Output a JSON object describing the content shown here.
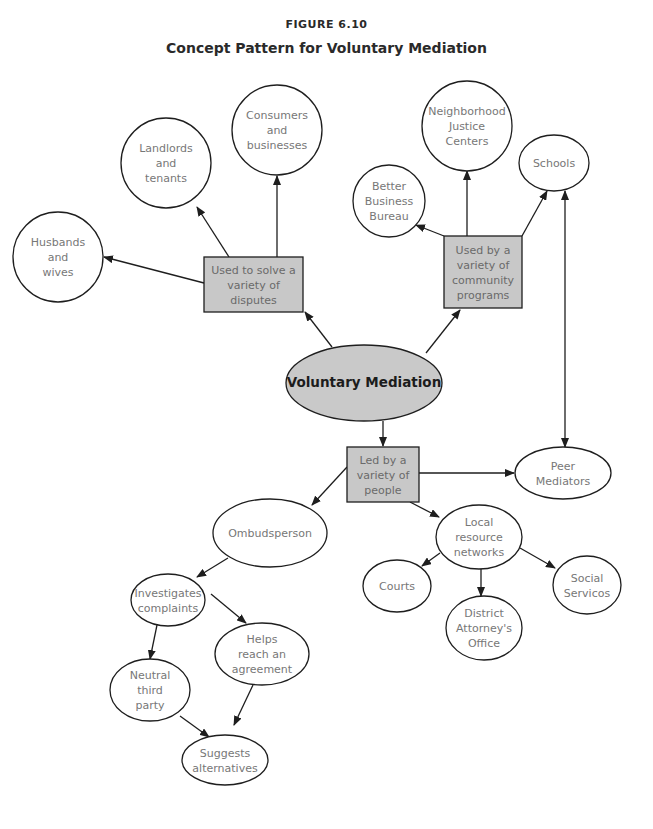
{
  "figure": {
    "label": "FIGURE 6.10",
    "title": "Concept Pattern for Voluntary Mediation"
  },
  "colors": {
    "box_fill": "#c8c8c8",
    "center_fill": "#c9c9c9",
    "circle_fill": "#ffffff",
    "stroke": "#1e1e1e"
  },
  "nodes": [
    {
      "id": "center",
      "shape": "ellipse",
      "cx": 364,
      "cy": 383,
      "rx": 78,
      "ry": 38,
      "lines": [
        "Voluntary Mediation"
      ],
      "style": "center"
    },
    {
      "id": "disputes",
      "shape": "box",
      "x": 204,
      "y": 257,
      "w": 99,
      "h": 55,
      "lines": [
        "Used to solve a",
        "variety of",
        "disputes"
      ]
    },
    {
      "id": "husbands",
      "shape": "circle",
      "cx": 58,
      "cy": 257,
      "r": 45,
      "lines": [
        "Husbands",
        "and",
        "wives"
      ]
    },
    {
      "id": "landlords",
      "shape": "circle",
      "cx": 166,
      "cy": 163,
      "r": 45,
      "lines": [
        "Landlords",
        "and",
        "tenants"
      ]
    },
    {
      "id": "consumers",
      "shape": "circle",
      "cx": 277,
      "cy": 130,
      "r": 45,
      "lines": [
        "Consumers",
        "and",
        "businesses"
      ]
    },
    {
      "id": "community",
      "shape": "box",
      "x": 444,
      "y": 236,
      "w": 78,
      "h": 72,
      "lines": [
        "Used by a",
        "variety of",
        "community",
        "programs"
      ]
    },
    {
      "id": "bbb",
      "shape": "circle",
      "cx": 389,
      "cy": 201,
      "r": 36,
      "lines": [
        "Better",
        "Business",
        "Bureau"
      ]
    },
    {
      "id": "nj",
      "shape": "circle",
      "cx": 467,
      "cy": 126,
      "r": 45,
      "lines": [
        "Neighborhood",
        "Justice",
        "Centers"
      ]
    },
    {
      "id": "schools",
      "shape": "ellipse",
      "cx": 554,
      "cy": 163,
      "rx": 35,
      "ry": 28,
      "lines": [
        "Schools"
      ]
    },
    {
      "id": "led",
      "shape": "box",
      "x": 347,
      "y": 447,
      "w": 72,
      "h": 55,
      "lines": [
        "Led by a",
        "variety of",
        "people"
      ]
    },
    {
      "id": "peer",
      "shape": "ellipse",
      "cx": 563,
      "cy": 473,
      "rx": 48,
      "ry": 26,
      "lines": [
        "Peer",
        "Mediators"
      ]
    },
    {
      "id": "ombuds",
      "shape": "ellipse",
      "cx": 270,
      "cy": 533,
      "rx": 57,
      "ry": 34,
      "lines": [
        "Ombudsperson"
      ]
    },
    {
      "id": "local",
      "shape": "ellipse",
      "cx": 479,
      "cy": 537,
      "rx": 43,
      "ry": 32,
      "lines": [
        "Local",
        "resource",
        "networks"
      ]
    },
    {
      "id": "courts",
      "shape": "ellipse",
      "cx": 397,
      "cy": 586,
      "rx": 34,
      "ry": 26,
      "lines": [
        "Courts"
      ]
    },
    {
      "id": "social",
      "shape": "ellipse",
      "cx": 587,
      "cy": 585,
      "rx": 34,
      "ry": 29,
      "lines": [
        "Social",
        "Servicos"
      ]
    },
    {
      "id": "da",
      "shape": "ellipse",
      "cx": 484,
      "cy": 628,
      "rx": 38,
      "ry": 32,
      "lines": [
        "District",
        "Attorney's",
        "Office"
      ]
    },
    {
      "id": "investigates",
      "shape": "ellipse",
      "cx": 168,
      "cy": 600,
      "rx": 37,
      "ry": 26,
      "lines": [
        "Investigates",
        "complaints"
      ]
    },
    {
      "id": "helps",
      "shape": "ellipse",
      "cx": 262,
      "cy": 654,
      "rx": 47,
      "ry": 31,
      "lines": [
        "Helps",
        "reach an",
        "agreement"
      ]
    },
    {
      "id": "neutral",
      "shape": "ellipse",
      "cx": 150,
      "cy": 690,
      "rx": 40,
      "ry": 31,
      "lines": [
        "Neutral",
        "third",
        "party"
      ]
    },
    {
      "id": "suggests",
      "shape": "ellipse",
      "cx": 225,
      "cy": 760,
      "rx": 43,
      "ry": 25,
      "lines": [
        "Suggests",
        "alternatives"
      ]
    }
  ],
  "edges": [
    {
      "from": [
        332,
        347
      ],
      "to": [
        305,
        312
      ],
      "head": "end"
    },
    {
      "from": [
        204,
        283
      ],
      "to": [
        104,
        257
      ],
      "head": "end"
    },
    {
      "from": [
        229,
        257
      ],
      "to": [
        197,
        207
      ],
      "head": "end"
    },
    {
      "from": [
        277,
        257
      ],
      "to": [
        277,
        176
      ],
      "head": "end"
    },
    {
      "from": [
        426,
        353
      ],
      "to": [
        460,
        310
      ],
      "head": "end"
    },
    {
      "from": [
        444,
        236
      ],
      "to": [
        416,
        225
      ],
      "head": "end"
    },
    {
      "from": [
        467,
        236
      ],
      "to": [
        467,
        171
      ],
      "head": "end"
    },
    {
      "from": [
        522,
        236
      ],
      "to": [
        547,
        191
      ],
      "head": "end"
    },
    {
      "from": [
        565,
        191
      ],
      "to": [
        565,
        447
      ],
      "head": "both"
    },
    {
      "from": [
        383,
        421
      ],
      "to": [
        383,
        446
      ],
      "head": "end"
    },
    {
      "from": [
        419,
        473
      ],
      "to": [
        514,
        473
      ],
      "head": "end"
    },
    {
      "from": [
        347,
        467
      ],
      "to": [
        312,
        505
      ],
      "head": "end"
    },
    {
      "from": [
        410,
        502
      ],
      "to": [
        439,
        517
      ],
      "head": "end"
    },
    {
      "from": [
        440,
        553
      ],
      "to": [
        422,
        566
      ],
      "head": "end"
    },
    {
      "from": [
        481,
        569
      ],
      "to": [
        481,
        596
      ],
      "head": "end"
    },
    {
      "from": [
        520,
        548
      ],
      "to": [
        555,
        568
      ],
      "head": "end"
    },
    {
      "from": [
        228,
        558
      ],
      "to": [
        197,
        577
      ],
      "head": "end"
    },
    {
      "from": [
        211,
        594
      ],
      "to": [
        246,
        623
      ],
      "head": "end"
    },
    {
      "from": [
        157,
        625
      ],
      "to": [
        150,
        659
      ],
      "head": "end"
    },
    {
      "from": [
        180,
        716
      ],
      "to": [
        209,
        737
      ],
      "head": "end"
    },
    {
      "from": [
        253,
        685
      ],
      "to": [
        234,
        725
      ],
      "head": "end"
    }
  ]
}
